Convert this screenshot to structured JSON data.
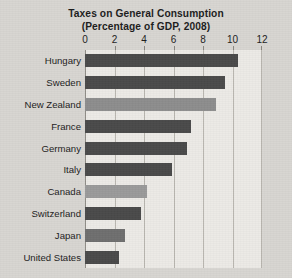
{
  "chart_data": {
    "type": "bar",
    "orientation": "horizontal",
    "title": "Taxes on General Consumption (Percentage of GDP, 2008)",
    "title_lines": [
      "Taxes on General Consumption",
      "(Percentage of GDP, 2008)"
    ],
    "xlabel": "",
    "ylabel": "",
    "xlim": [
      0,
      12
    ],
    "xticks": [
      0,
      2,
      4,
      6,
      8,
      10,
      12
    ],
    "xtick_labels": [
      "0",
      "2",
      "4",
      "6",
      "8",
      "10",
      "12"
    ],
    "grid": "vertical",
    "legend": "none",
    "categories": [
      "Hungary",
      "Sweden",
      "New Zealand",
      "France",
      "Germany",
      "Italy",
      "Canada",
      "Switzerland",
      "Japan",
      "United States"
    ],
    "values": [
      10.4,
      9.5,
      8.9,
      7.2,
      6.9,
      5.9,
      4.2,
      3.8,
      2.7,
      2.3
    ],
    "bar_colors": [
      "#4a4a4a",
      "#4a4a4a",
      "#8d8d8d",
      "#4a4a4a",
      "#4a4a4a",
      "#4a4a4a",
      "#9a9a9a",
      "#4a4a4a",
      "#6f6f6f",
      "#4a4a4a"
    ],
    "colors": {
      "dark_bar": "#4a4a4a",
      "light_bar": "#9a9a9a",
      "plot_background": "#eceae6",
      "page_background": "#d8d6d2",
      "gridline": "#b9b6b0",
      "text": "#1c1c1c"
    }
  }
}
